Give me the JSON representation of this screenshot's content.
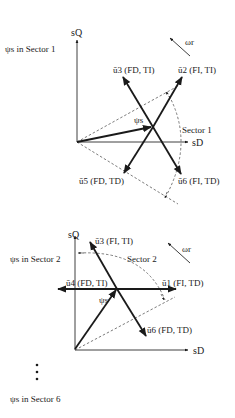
{
  "diagram": {
    "top": {
      "sector_title": "ψs in Sector 1",
      "axis_q": "sQ",
      "axis_d": "sD",
      "rotation_label": "ωr",
      "flux_label": "ψs",
      "sector_label": "Sector 1",
      "vectors": [
        {
          "name": "u3",
          "label": "ū3 (FD, TI)"
        },
        {
          "name": "u2",
          "label": "ū2 (FI, TI)"
        },
        {
          "name": "u5",
          "label": "ū5 (FD, TD)"
        },
        {
          "name": "u6",
          "label": "ū6 (FI, TD)"
        }
      ]
    },
    "bottom": {
      "sector_title": "ψs in Sector 2",
      "axis_q": "sQ",
      "axis_d": "sD",
      "rotation_label": "ωr",
      "flux_label": "ψs",
      "sector_label": "Sector 2",
      "vectors": [
        {
          "name": "u3",
          "label": "ū3 (FI, TI)"
        },
        {
          "name": "u4",
          "label": "ū4 (FD, TI)"
        },
        {
          "name": "u1",
          "label": "ū1 (FI, TD)"
        },
        {
          "name": "u6",
          "label": "ū6 (FD, TD)"
        }
      ]
    },
    "ellipsis": "⋮",
    "footer_title": "ψs in Sector 6"
  }
}
